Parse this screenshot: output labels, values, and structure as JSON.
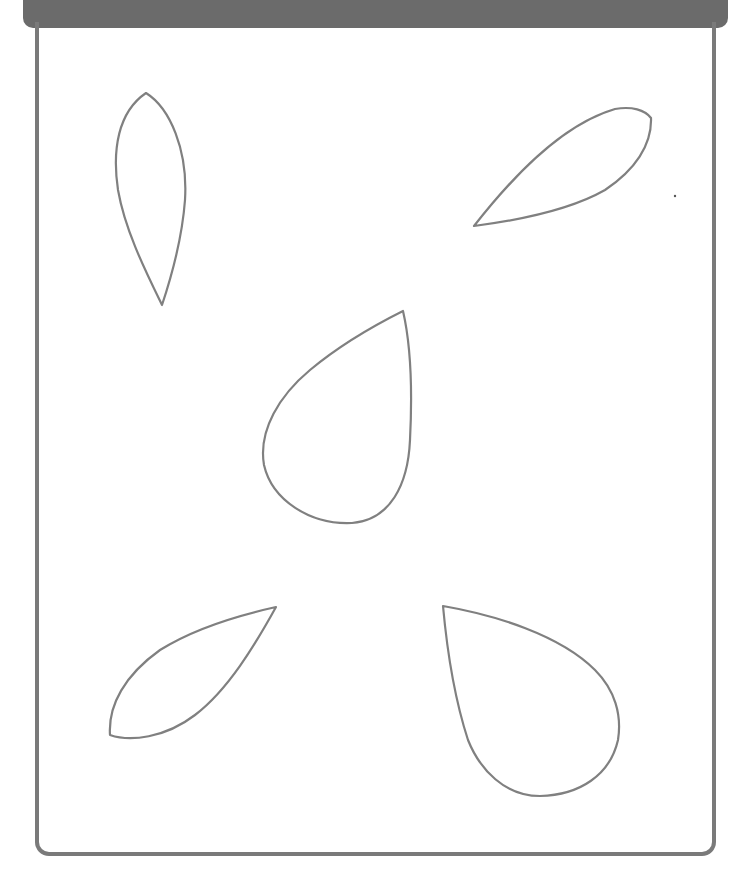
{
  "worksheet": {
    "header_color": "#6b6b6b",
    "frame_color": "#7a7a7a",
    "outline_color": "#808080",
    "shape_count": 5,
    "shapes": [
      {
        "name": "petal-top-left",
        "description": "narrow vertical teardrop"
      },
      {
        "name": "petal-top-right",
        "description": "horizontal leaf shape pointing left"
      },
      {
        "name": "teardrop-center",
        "description": "large teardrop pointing up-right"
      },
      {
        "name": "petal-bottom-left",
        "description": "diagonal leaf pointing up-right"
      },
      {
        "name": "teardrop-bottom-right",
        "description": "large teardrop pointing up-left"
      }
    ]
  }
}
